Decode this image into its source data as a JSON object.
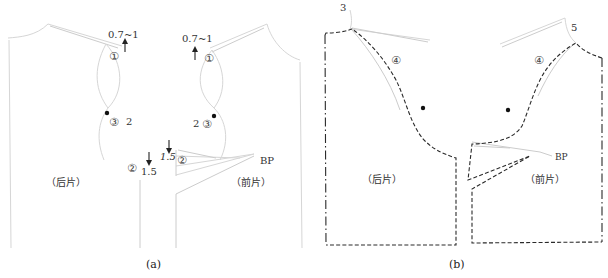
{
  "figure": {
    "panel_a": {
      "caption": "(a)",
      "back_piece_label": "（后片）",
      "front_piece_label": "（前片）",
      "annotations": {
        "shoulder_raise_back": "0.7~1",
        "shoulder_raise_front": "0.7~1",
        "step1_back": "①",
        "step1_front": "①",
        "step3_back": "③",
        "step3_front": "③",
        "armhole_back_value": "2",
        "armhole_front_value": "2",
        "step2_back": "②",
        "step2_front": "②",
        "side_drop_back": "1.5",
        "side_drop_front": "1.5",
        "bust_point": "BP"
      }
    },
    "panel_b": {
      "caption": "(b)",
      "back_piece_label": "（后片）",
      "front_piece_label": "（前片）",
      "annotations": {
        "back_shoulder_value": "3",
        "front_shoulder_value": "5",
        "step4_back": "④",
        "step4_front": "④",
        "bust_point": "BP"
      }
    }
  }
}
